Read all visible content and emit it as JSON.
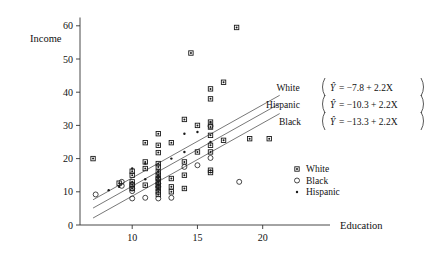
{
  "chart_data": {
    "type": "scatter",
    "title": "",
    "xlabel": "Education",
    "ylabel": "Income",
    "xlim": [
      6,
      21.5
    ],
    "ylim": [
      0,
      62
    ],
    "grid": false,
    "xticks": [
      10,
      15,
      20
    ],
    "yticks": [
      0,
      10,
      20,
      30,
      40,
      50,
      60
    ],
    "legend_position": "right-middle",
    "legend": [
      {
        "marker": "square-asterisk",
        "label": "White"
      },
      {
        "marker": "open-circle",
        "label": "Black"
      },
      {
        "marker": "small-dot",
        "label": "Hispanic"
      }
    ],
    "series": [
      {
        "name": "White",
        "marker": "square-asterisk",
        "points": [
          [
            7.0,
            20.0
          ],
          [
            9.0,
            12.6
          ],
          [
            10.0,
            16.2
          ],
          [
            10.0,
            15.0
          ],
          [
            10.0,
            13.0
          ],
          [
            10.0,
            12.2
          ],
          [
            10.0,
            11.0
          ],
          [
            11.0,
            24.8
          ],
          [
            11.0,
            19.0
          ],
          [
            11.0,
            17.0
          ],
          [
            11.0,
            12.0
          ],
          [
            12.0,
            27.5
          ],
          [
            12.0,
            24.0
          ],
          [
            12.0,
            21.8
          ],
          [
            12.0,
            18.5
          ],
          [
            12.0,
            17.5
          ],
          [
            12.0,
            16.0
          ],
          [
            12.0,
            15.0
          ],
          [
            12.0,
            14.0
          ],
          [
            12.0,
            13.0
          ],
          [
            12.0,
            12.0
          ],
          [
            12.0,
            11.0
          ],
          [
            12.0,
            10.0
          ],
          [
            12.0,
            9.2
          ],
          [
            13.0,
            24.8
          ],
          [
            13.0,
            14.0
          ],
          [
            13.0,
            11.5
          ],
          [
            13.0,
            10.0
          ],
          [
            14.0,
            31.8
          ],
          [
            14.0,
            19.0
          ],
          [
            14.0,
            15.0
          ],
          [
            14.0,
            11.0
          ],
          [
            14.5,
            51.8
          ],
          [
            15.0,
            30.0
          ],
          [
            15.0,
            22.0
          ],
          [
            16.0,
            41.0
          ],
          [
            16.0,
            38.0
          ],
          [
            16.0,
            31.0
          ],
          [
            16.0,
            29.5
          ],
          [
            16.0,
            27.0
          ],
          [
            16.0,
            24.0
          ],
          [
            16.0,
            22.0
          ],
          [
            16.0,
            16.5
          ],
          [
            16.0,
            15.8
          ],
          [
            17.0,
            43.0
          ],
          [
            17.0,
            25.5
          ],
          [
            18.0,
            59.5
          ],
          [
            19.0,
            26.0
          ],
          [
            20.5,
            26.0
          ]
        ]
      },
      {
        "name": "Black",
        "marker": "open-circle",
        "points": [
          [
            7.2,
            9.2
          ],
          [
            9.2,
            13.0
          ],
          [
            9.2,
            11.8
          ],
          [
            10.0,
            12.0
          ],
          [
            10.0,
            11.0
          ],
          [
            10.0,
            10.2
          ],
          [
            10.0,
            8.0
          ],
          [
            11.0,
            8.2
          ],
          [
            12.0,
            14.0
          ],
          [
            12.0,
            12.5
          ],
          [
            12.0,
            11.5
          ],
          [
            12.0,
            8.0
          ],
          [
            13.0,
            8.2
          ],
          [
            14.0,
            17.5
          ],
          [
            15.0,
            18.0
          ],
          [
            16.0,
            20.2
          ],
          [
            16.0,
            29.8
          ],
          [
            18.2,
            13.0
          ]
        ]
      },
      {
        "name": "Hispanic",
        "marker": "small-dot",
        "points": [
          [
            8.2,
            10.5
          ],
          [
            9.0,
            11.5
          ],
          [
            10.0,
            17.0
          ],
          [
            11.0,
            18.5
          ],
          [
            11.0,
            13.8
          ],
          [
            12.0,
            16.2
          ],
          [
            12.0,
            15.0
          ],
          [
            12.0,
            14.2
          ],
          [
            12.0,
            13.0
          ],
          [
            12.0,
            12.2
          ],
          [
            12.0,
            11.0
          ],
          [
            13.0,
            20.0
          ],
          [
            14.0,
            22.0
          ],
          [
            14.0,
            27.5
          ],
          [
            15.0,
            28.0
          ],
          [
            16.0,
            31.0
          ],
          [
            16.0,
            25.0
          ]
        ]
      }
    ],
    "regression_lines": [
      {
        "group": "White",
        "intercept": -7.8,
        "slope": 2.2,
        "equation_label": "White",
        "equation_text": "Ŷ = −7.8 + 2.2X",
        "eq_lhs": "Ŷ",
        "eq_rhs": "= −7.8 + 2.2X",
        "x_start": 7.0,
        "x_end": 21.3
      },
      {
        "group": "Hispanic",
        "intercept": -10.3,
        "slope": 2.2,
        "equation_label": "Hispanic",
        "equation_text": "Ŷ = −10.3 + 2.2X",
        "eq_lhs": "Ŷ",
        "eq_rhs": "= −10.3 + 2.2X",
        "x_start": 7.0,
        "x_end": 21.3
      },
      {
        "group": "Black",
        "intercept": -13.3,
        "slope": 2.2,
        "equation_label": "Black",
        "equation_text": "Ŷ = −13.3 + 2.2X",
        "eq_lhs": "Ŷ",
        "eq_rhs": "= −13.3 + 2.2X",
        "x_start": 7.0,
        "x_end": 21.3
      }
    ]
  },
  "axes": {
    "y_title": "Income",
    "x_title": "Education",
    "x_tick_labels": [
      "10",
      "15",
      "20"
    ],
    "y_tick_labels": [
      "0",
      "10",
      "20",
      "30",
      "40",
      "50",
      "60"
    ]
  }
}
